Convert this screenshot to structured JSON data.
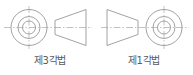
{
  "diagram": {
    "title": "",
    "colors": {
      "outline": "#8a8a8a",
      "centerline": "#9a9a9a",
      "background": "#ffffff",
      "text": "#5a5a5a"
    },
    "panels": [
      {
        "id": "third-angle",
        "label": "제3각법",
        "label_meaning": "Third Angle Projection",
        "left_view": "front-view-circles",
        "right_view": "side-view-trapezoid-narrow-left",
        "circle_outer_d": 36,
        "circle_mid_d": 22,
        "circle_inner_d": 13,
        "trapezoid_left_h": 14,
        "trapezoid_right_h": 32
      },
      {
        "id": "first-angle",
        "label": "제1각법",
        "label_meaning": "First Angle Projection",
        "left_view": "side-view-trapezoid-wide-left",
        "right_view": "front-view-circles",
        "circle_outer_d": 36,
        "circle_mid_d": 22,
        "circle_inner_d": 13,
        "trapezoid_left_h": 32,
        "trapezoid_right_h": 14
      }
    ]
  }
}
